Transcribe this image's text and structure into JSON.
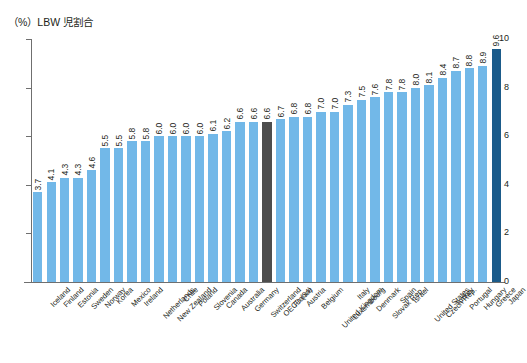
{
  "chart_data": {
    "type": "bar",
    "title": "（%）LBW 児割合",
    "xlabel": "",
    "ylabel": "",
    "ylim": [
      0,
      10
    ],
    "yticks": [
      0,
      2,
      4,
      6,
      8,
      10
    ],
    "grid": false,
    "legend": null,
    "categories": [
      "Iceland",
      "Finland",
      "Estonia",
      "Sweden",
      "Norway",
      "Korea",
      "Mexico",
      "Ireland",
      "Netherlands",
      "New Zealand",
      "Chile",
      "Poland",
      "Slovenia",
      "Canada",
      "Australia",
      "Germany",
      "Switzerland",
      "OECD (34)",
      "France",
      "Austria",
      "Belgium",
      "United Kingdom",
      "Luxembourg",
      "Italy",
      "Denmark",
      "Slovak Rep.",
      "Spain",
      "Israel",
      "United States",
      "Czech Rep.",
      "Turkey",
      "Portugal",
      "Hungary",
      "Greece",
      "Japan"
    ],
    "values": [
      3.7,
      4.1,
      4.3,
      4.3,
      4.6,
      5.5,
      5.5,
      5.8,
      5.8,
      6.0,
      6.0,
      6.0,
      6.0,
      6.1,
      6.2,
      6.6,
      6.6,
      6.6,
      6.7,
      6.8,
      6.8,
      7.0,
      7.0,
      7.3,
      7.5,
      7.6,
      7.8,
      7.8,
      8.0,
      8.1,
      8.4,
      8.7,
      8.8,
      8.9,
      9.6
    ],
    "value_labels": [
      "3.7",
      "4.1",
      "4.3",
      "4.3",
      "4.6",
      "5.5",
      "5.5",
      "5.8",
      "5.8",
      "6.0",
      "6.0",
      "6.0",
      "6.0",
      "6.1",
      "6.2",
      "6.6",
      "6.6",
      "6.6",
      "6.7",
      "6.8",
      "6.8",
      "7.0",
      "7.0",
      "7.3",
      "7.5",
      "7.6",
      "7.8",
      "7.8",
      "8.0",
      "8.1",
      "8.4",
      "8.7",
      "8.8",
      "8.9",
      "9.6"
    ],
    "highlight": {
      "oecd_index": 17,
      "japan_index": 34
    },
    "colors": {
      "bar": "#72b8e8",
      "oecd_bar": "#4d4d4d",
      "japan_bar": "#1b5b8a",
      "axis": "#6f6f6f",
      "text": "#231f20",
      "background": "#ffffff"
    }
  }
}
